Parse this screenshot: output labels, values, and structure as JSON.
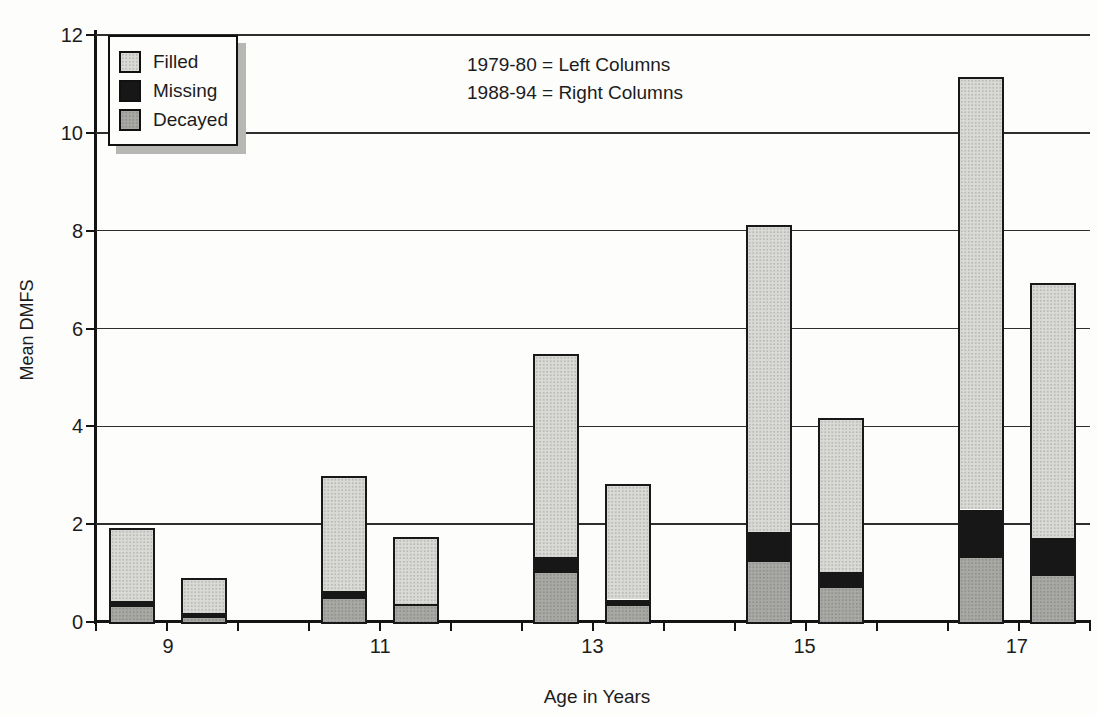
{
  "colors": {
    "filled": "#d9d9d5",
    "missing": "#171717",
    "decayed": "#a8a8a4",
    "axis": "#141414",
    "gridline": "#2e2e2e",
    "legend_shadow": "#b7b7b3",
    "background": "#fdfdfc"
  },
  "chart_data": {
    "type": "bar",
    "stacked": true,
    "title": "",
    "xlabel": "Age in Years",
    "ylabel": "Mean DMFS",
    "ylim": [
      0,
      12
    ],
    "yticks": [
      0,
      2,
      4,
      6,
      8,
      10,
      12
    ],
    "grid": "horizontal",
    "legend_position": "top-left-inside",
    "legend_labels": [
      "Filled",
      "Missing",
      "Decayed"
    ],
    "stack_order_bottom_to_top": [
      "Decayed",
      "Missing",
      "Filled"
    ],
    "annotations": [
      "1979-80 = Left Columns",
      "1988-94 = Right Columns"
    ],
    "categories": [
      "9",
      "11",
      "13",
      "15",
      "17"
    ],
    "series": [
      {
        "name": "1979-80",
        "column": "left",
        "decayed": [
          0.3,
          0.47,
          1.0,
          1.23,
          1.3
        ],
        "missing": [
          0.13,
          0.17,
          0.33,
          0.6,
          1.0
        ],
        "filled": [
          1.45,
          2.31,
          4.1,
          6.25,
          8.8
        ],
        "total": [
          1.88,
          2.95,
          5.43,
          8.08,
          11.1
        ]
      },
      {
        "name": "1988-94",
        "column": "right",
        "decayed": [
          0.08,
          0.32,
          0.33,
          0.7,
          0.95
        ],
        "missing": [
          0.1,
          0.05,
          0.13,
          0.33,
          0.77
        ],
        "filled": [
          0.67,
          1.33,
          2.32,
          3.1,
          5.16
        ],
        "total": [
          0.85,
          1.7,
          2.78,
          4.13,
          6.88
        ]
      }
    ]
  }
}
